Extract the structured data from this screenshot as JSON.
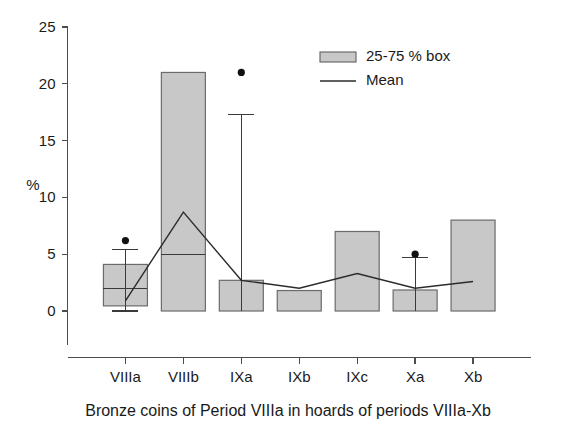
{
  "chart_data": {
    "type": "bar",
    "title": "",
    "subtitle": "",
    "caption": "Bronze coins of Period VIIIa in hoards of periods VIIIa-Xb",
    "xlabel": "",
    "ylabel": "%",
    "ylim": [
      0,
      25
    ],
    "yticks": [
      0,
      5,
      10,
      15,
      20,
      25
    ],
    "ytick_labels": [
      "0",
      "5",
      "10",
      "15",
      "20",
      "25"
    ],
    "grid": false,
    "legend_position": "top-right",
    "categories": [
      "VIIIa",
      "VIIIb",
      "IXa",
      "IXb",
      "IXc",
      "Xa",
      "Xb"
    ],
    "series": [
      {
        "name": "25-75 % box",
        "kind": "box",
        "q1": [
          0.45,
          0.0,
          0.0,
          0.0,
          0.0,
          0.0,
          0.0
        ],
        "q3": [
          4.1,
          21.0,
          2.7,
          1.8,
          7.0,
          1.85,
          8.0
        ],
        "median": [
          2.0,
          5.0,
          null,
          null,
          null,
          null,
          null
        ],
        "whisker_low": [
          0.0,
          null,
          null,
          null,
          null,
          null,
          null
        ],
        "whisker_high": [
          5.4,
          null,
          17.3,
          null,
          null,
          4.7,
          null
        ],
        "outliers": [
          [
            6.2
          ],
          [],
          [
            21.0
          ],
          [],
          [],
          [
            5.0
          ],
          []
        ]
      },
      {
        "name": "Mean",
        "kind": "line",
        "values": [
          0.9,
          8.7,
          2.7,
          2.0,
          3.3,
          2.0,
          2.6
        ]
      }
    ],
    "legend": [
      {
        "label": "25-75 % box",
        "marker": "box-swatch",
        "color": "#c8c8c8"
      },
      {
        "label": "Mean",
        "marker": "line",
        "color": "#2b2b2b"
      }
    ],
    "colors": {
      "box_fill": "#c8c8c8",
      "box_stroke": "#6b6b6b",
      "mean_line": "#2b2b2b",
      "outlier": "#111111",
      "axis": "#4d4d4d",
      "text": "#1a1a1a",
      "background": "#ffffff"
    }
  }
}
